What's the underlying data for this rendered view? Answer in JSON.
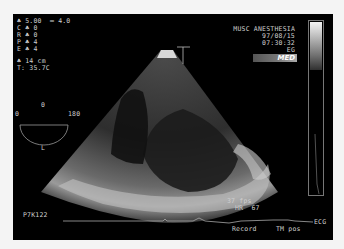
{
  "params": {
    "depth_line": "♣ 5.00  ═ 4.0",
    "c_line": "C ♣ 0",
    "r_line": "R ♣ 0",
    "p_line": "P ♣ 4",
    "e_line": "E ♣ 4",
    "depth_cm": "♣ 14 cm",
    "temperature": "T: 35.7C"
  },
  "orientation": {
    "top_label": "0",
    "left_label": "0",
    "right_label": "180",
    "bottom_label": "L"
  },
  "header": {
    "institution": "MUSC ANESTHESIA",
    "date": "97/08/15",
    "time": "07:30:32",
    "mode": "EG",
    "logo": "MED"
  },
  "footer": {
    "frame_rate": "37 fps",
    "heart_rate": "HR  67",
    "probe_id": "P7K122",
    "ecg_label": "ECG",
    "record_label": "Record",
    "tm_label": "TM pos"
  },
  "colors": {
    "background": "#000000",
    "text": "#cfcfcf",
    "frame": "#f4f4f4"
  }
}
